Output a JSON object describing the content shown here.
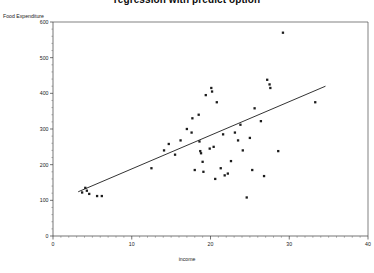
{
  "chart_data": {
    "type": "scatter",
    "title": "regression with predict option",
    "xlabel": "income",
    "ylabel": "Food Expenditure",
    "xlim": [
      0,
      40
    ],
    "ylim": [
      0,
      600
    ],
    "xticks": [
      0,
      10,
      20,
      30,
      40
    ],
    "yticks": [
      0,
      100,
      200,
      300,
      400,
      500,
      600
    ],
    "xtick_labels": [
      "0",
      "10",
      "20",
      "30",
      "40"
    ],
    "ytick_labels": [
      "0",
      "100",
      "200",
      "300",
      "400",
      "500",
      "600"
    ],
    "grid": false,
    "legend": false,
    "minor_ticks": true,
    "series": [
      {
        "name": "observations",
        "type": "scatter",
        "marker": "square",
        "color": "#1c1c1c",
        "points": [
          [
            3.7,
            122
          ],
          [
            4.1,
            135
          ],
          [
            4.3,
            127
          ],
          [
            4.6,
            118
          ],
          [
            5.6,
            112
          ],
          [
            6.2,
            112
          ],
          [
            12.5,
            190
          ],
          [
            14.1,
            240
          ],
          [
            14.7,
            258
          ],
          [
            15.5,
            228
          ],
          [
            16.2,
            268
          ],
          [
            17.0,
            300
          ],
          [
            17.6,
            290
          ],
          [
            17.7,
            330
          ],
          [
            18.0,
            185
          ],
          [
            18.5,
            340
          ],
          [
            18.6,
            265
          ],
          [
            18.7,
            238
          ],
          [
            18.8,
            232
          ],
          [
            19.0,
            208
          ],
          [
            19.1,
            180
          ],
          [
            19.4,
            395
          ],
          [
            19.9,
            245
          ],
          [
            20.1,
            415
          ],
          [
            20.2,
            405
          ],
          [
            20.4,
            250
          ],
          [
            20.6,
            160
          ],
          [
            20.8,
            375
          ],
          [
            21.3,
            190
          ],
          [
            21.6,
            285
          ],
          [
            21.8,
            170
          ],
          [
            22.2,
            175
          ],
          [
            22.6,
            210
          ],
          [
            23.1,
            290
          ],
          [
            23.5,
            268
          ],
          [
            23.8,
            312
          ],
          [
            24.1,
            240
          ],
          [
            24.6,
            108
          ],
          [
            25.0,
            275
          ],
          [
            25.3,
            185
          ],
          [
            25.6,
            358
          ],
          [
            26.4,
            322
          ],
          [
            26.8,
            168
          ],
          [
            27.2,
            438
          ],
          [
            27.5,
            425
          ],
          [
            27.6,
            415
          ],
          [
            28.6,
            238
          ],
          [
            29.2,
            570
          ],
          [
            33.3,
            375
          ]
        ]
      },
      {
        "name": "fitted regression line",
        "type": "line",
        "color": "#1c1c1c",
        "points": [
          [
            3.2,
            124
          ],
          [
            34.6,
            420
          ]
        ]
      }
    ]
  }
}
